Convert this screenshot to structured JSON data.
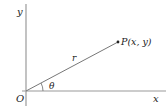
{
  "diagram": {
    "type": "polar-coordinates",
    "labels": {
      "y_axis": "y",
      "x_axis": "x",
      "origin": "O",
      "radius": "r",
      "angle": "θ",
      "point": "P(x, y)"
    },
    "colors": {
      "axis": "#9a9a9a",
      "ray": "#777777",
      "text": "#222222",
      "point": "#222222"
    }
  }
}
